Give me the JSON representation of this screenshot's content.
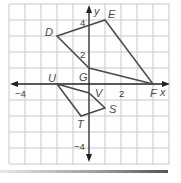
{
  "diagram": {
    "type": "coordinate-plane",
    "grid": {
      "xmin": -5,
      "xmax": 5,
      "ymin": -5,
      "ymax": 5,
      "step": 1
    },
    "axes": {
      "x_label": "x",
      "y_label": "y"
    },
    "tick_labels": {
      "x_neg4": "−4",
      "x_2": "2",
      "y_4": "4",
      "y_2": "2",
      "y_neg4": "−4"
    },
    "shapes": [
      {
        "name": "DEFG",
        "vertices": [
          {
            "label": "D",
            "x": -2,
            "y": 3
          },
          {
            "label": "E",
            "x": 1,
            "y": 4
          },
          {
            "label": "F",
            "x": 4,
            "y": 0
          },
          {
            "label": "G",
            "x": 0,
            "y": 1
          }
        ]
      },
      {
        "name": "STUV",
        "vertices": [
          {
            "label": "U",
            "x": -2,
            "y": 0
          },
          {
            "label": "V",
            "x": 0,
            "y": -0.5
          },
          {
            "label": "S",
            "x": 1,
            "y": -1.5
          },
          {
            "label": "T",
            "x": -0.5,
            "y": -2
          }
        ]
      }
    ],
    "labels": {
      "D": "D",
      "E": "E",
      "F": "F",
      "G": "G",
      "S": "S",
      "T": "T",
      "U": "U",
      "V": "V"
    },
    "colors": {
      "grid": "#c8c8c8",
      "axes": "#222222",
      "shape": "#4a4a4a",
      "labels": "#4a4a4a"
    }
  }
}
